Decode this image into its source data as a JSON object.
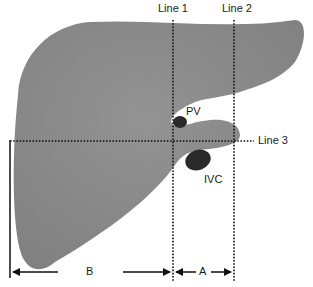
{
  "diagram": {
    "colors": {
      "liver_fill": "#8c8c8c",
      "vessel_fill": "#2a2a2a",
      "line_color": "#111111",
      "background": "#ffffff"
    },
    "lines": [
      {
        "id": "line1",
        "label": "Line 1",
        "orientation": "vertical",
        "style": "dotted"
      },
      {
        "id": "line2",
        "label": "Line 2",
        "orientation": "vertical",
        "style": "dotted"
      },
      {
        "id": "line3",
        "label": "Line 3",
        "orientation": "horizontal",
        "style": "dotted"
      }
    ],
    "structures": [
      {
        "id": "pv",
        "label": "PV"
      },
      {
        "id": "ivc",
        "label": "IVC"
      }
    ],
    "measurements": [
      {
        "id": "b",
        "label": "B"
      },
      {
        "id": "a",
        "label": "A"
      }
    ]
  }
}
